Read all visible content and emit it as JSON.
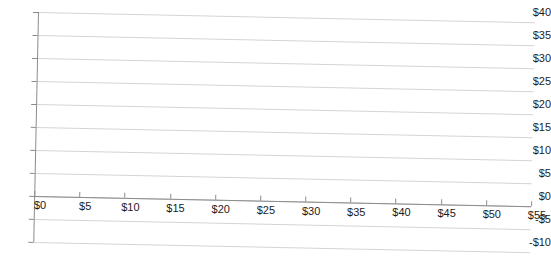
{
  "chart_data": {
    "type": "line",
    "title": "",
    "subtitle": "",
    "xlabel": "",
    "ylabel": "",
    "xlim": [
      0,
      55
    ],
    "ylim": [
      -10,
      40
    ],
    "grid": true,
    "legend": false,
    "legend_position": "none",
    "series": [],
    "annotations": [],
    "note": "Empty plot area - axes and gridlines only, no data series drawn",
    "x_ticks": [
      {
        "value": 0,
        "label": "$0"
      },
      {
        "value": 5,
        "label": "$5"
      },
      {
        "value": 10,
        "label": "$10"
      },
      {
        "value": 15,
        "label": "$15"
      },
      {
        "value": 20,
        "label": "$20"
      },
      {
        "value": 25,
        "label": "$25"
      },
      {
        "value": 30,
        "label": "$30"
      },
      {
        "value": 35,
        "label": "$35"
      },
      {
        "value": 40,
        "label": "$40"
      },
      {
        "value": 45,
        "label": "$45"
      },
      {
        "value": 50,
        "label": "$50"
      },
      {
        "value": 55,
        "label": "$55"
      }
    ],
    "y_ticks": [
      {
        "value": 40,
        "label": "$40"
      },
      {
        "value": 35,
        "label": "$35"
      },
      {
        "value": 30,
        "label": "$30"
      },
      {
        "value": 25,
        "label": "$25"
      },
      {
        "value": 20,
        "label": "$20"
      },
      {
        "value": 15,
        "label": "$15"
      },
      {
        "value": 10,
        "label": "$10"
      },
      {
        "value": 5,
        "label": "$5"
      },
      {
        "value": 0,
        "label": "$0"
      },
      {
        "value": -5,
        "label": "-$5"
      },
      {
        "value": -10,
        "label": "-$10"
      }
    ]
  },
  "colors": {
    "background": "#ffffff",
    "gridline": "#c9c9c9",
    "axis": "#8c8c8c",
    "text": "#1c1c1c"
  }
}
